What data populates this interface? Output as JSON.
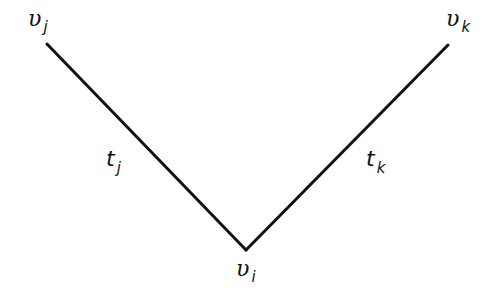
{
  "diagram": {
    "type": "graph",
    "stroke_color": "#111111",
    "background": "#ffffff",
    "nodes": [
      {
        "id": "v_j",
        "symbol": "υ",
        "subscript": "j",
        "x": 47,
        "y": 44
      },
      {
        "id": "v_k",
        "symbol": "υ",
        "subscript": "k",
        "x": 448,
        "y": 45
      },
      {
        "id": "v_i",
        "symbol": "υ",
        "subscript": "i",
        "x": 246,
        "y": 250
      }
    ],
    "edges": [
      {
        "from": "v_j",
        "to": "v_i",
        "symbol": "t",
        "subscript": "j"
      },
      {
        "from": "v_i",
        "to": "v_k",
        "symbol": "t",
        "subscript": "k"
      }
    ]
  }
}
